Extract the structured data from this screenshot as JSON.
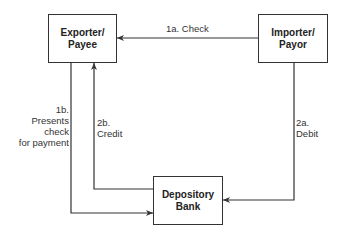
{
  "diagram": {
    "type": "flow",
    "nodes": [
      {
        "id": "exporter",
        "label": "Exporter/\nPayee"
      },
      {
        "id": "importer",
        "label": "Importer/\nPayor"
      },
      {
        "id": "bank",
        "label": "Depository\nBank"
      }
    ],
    "edges": [
      {
        "id": "1a",
        "from": "importer",
        "to": "exporter",
        "label": "1a. Check"
      },
      {
        "id": "1b",
        "from": "exporter",
        "to": "bank",
        "label": "1b.\nPresents\ncheck\nfor payment"
      },
      {
        "id": "2a",
        "from": "importer",
        "to": "bank",
        "label": "2a.\nDebit"
      },
      {
        "id": "2b",
        "from": "bank",
        "to": "exporter",
        "label": "2b.\nCredit"
      }
    ],
    "line_color": "#333333"
  }
}
